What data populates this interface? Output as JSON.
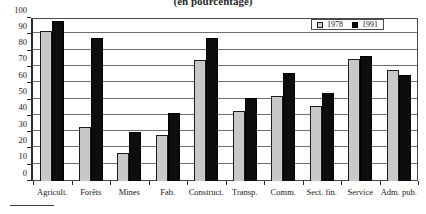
{
  "chart_data": {
    "type": "bar",
    "title": "(en pourcentage)",
    "xlabel": "",
    "ylabel": "",
    "ylim": [
      0,
      100
    ],
    "yticks": [
      0,
      10,
      20,
      30,
      40,
      50,
      60,
      70,
      80,
      90,
      100
    ],
    "grid": true,
    "legend_position": "top-right",
    "categories": [
      "Agricult.",
      "Forêts",
      "Mines",
      "Fab.",
      "Construct.",
      "Transp.",
      "Comm.",
      "Sect. fin.",
      "Service",
      "Adm. pub."
    ],
    "series": [
      {
        "name": "1978",
        "color": "#c8c8c8",
        "values": [
          92,
          33,
          17,
          28,
          74,
          43,
          52,
          46,
          75,
          68
        ]
      },
      {
        "name": "1991",
        "color": "#0d0d0d",
        "values": [
          98,
          88,
          30,
          42,
          88,
          51,
          66,
          54,
          77,
          65
        ]
      }
    ]
  }
}
